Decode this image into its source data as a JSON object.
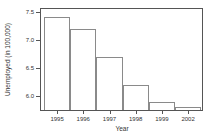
{
  "chart_data": {
    "type": "bar",
    "title": "",
    "categories": [
      "1995",
      "1996",
      "1997",
      "1998",
      "1999",
      "2002"
    ],
    "values": [
      7.4,
      7.2,
      6.7,
      6.2,
      5.9,
      5.8
    ],
    "xlabel": "Year",
    "ylabel": "Unemployed (in 100,000)",
    "ylim": [
      5.75,
      7.55
    ],
    "yticks": [
      6.0,
      6.5,
      7.0,
      7.5
    ],
    "ytick_labels": [
      "6.0",
      "6.5",
      "7.0",
      "7.5"
    ],
    "grid": false,
    "legend": null,
    "bar_fill": "#ffffff",
    "bar_border": "#8a8a8a",
    "frame_color": "#555555",
    "text_color": "#333333"
  }
}
